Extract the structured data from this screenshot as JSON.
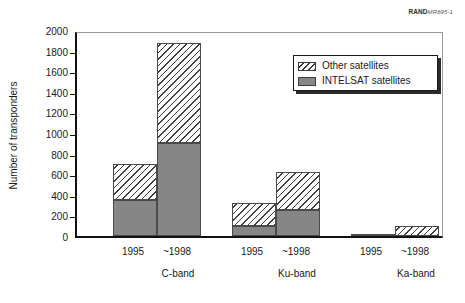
{
  "figure_id": {
    "brand": "RAND",
    "number": "MR695-1"
  },
  "chart_data": {
    "type": "bar",
    "subtype": "stacked-vertical",
    "title": "",
    "xlabel": "",
    "ylabel": "Number of transponders",
    "ylim": [
      0,
      2000
    ],
    "ytick_step": 200,
    "yticks": [
      0,
      200,
      400,
      600,
      800,
      1000,
      1200,
      1400,
      1600,
      1800,
      2000
    ],
    "ytick_labels": [
      "0",
      "200",
      "400",
      "600",
      "800",
      "1000",
      "1200",
      "1400",
      "1600",
      "1800",
      "2000"
    ],
    "grid": false,
    "legend_position": "upper-right-inside",
    "groups": [
      "C-band",
      "Ku-band",
      "Ka-band"
    ],
    "categories": [
      "1995",
      "~1998",
      "1995",
      "~1998",
      "1995",
      "~1998"
    ],
    "series": [
      {
        "name": "INTELSAT satellites",
        "color": "#868686",
        "fill": "solid",
        "values": [
          350,
          900,
          100,
          250,
          0,
          0
        ]
      },
      {
        "name": "Other satellites",
        "color": "#3d3d3d",
        "fill": "diagonal-hatch",
        "values": [
          350,
          970,
          225,
          370,
          20,
          100
        ]
      }
    ],
    "totals": [
      700,
      1870,
      325,
      620,
      20,
      100
    ]
  },
  "legend": {
    "items": [
      {
        "label": "Other satellites",
        "swatch": "other"
      },
      {
        "label": "INTELSAT satellites",
        "swatch": "intelsat"
      }
    ]
  },
  "axis": {
    "y_title": "Number of transponders"
  },
  "bars": [
    {
      "name": "c-band-1995",
      "group": "C-band",
      "year": "1995",
      "left": 36,
      "width": 44,
      "intelsat": 350,
      "other_top": 700
    },
    {
      "name": "c-band-1998",
      "group": "C-band",
      "year": "~1998",
      "left": 80,
      "width": 44,
      "intelsat": 900,
      "other_top": 1870
    },
    {
      "name": "ku-band-1995",
      "group": "Ku-band",
      "year": "1995",
      "left": 155,
      "width": 44,
      "intelsat": 100,
      "other_top": 325
    },
    {
      "name": "ku-band-1998",
      "group": "Ku-band",
      "year": "~1998",
      "left": 199,
      "width": 44,
      "intelsat": 250,
      "other_top": 620
    },
    {
      "name": "ka-band-1995",
      "group": "Ka-band",
      "year": "1995",
      "left": 274,
      "width": 44,
      "intelsat": 0,
      "other_top": 20
    },
    {
      "name": "ka-band-1998",
      "group": "Ka-band",
      "year": "~1998",
      "left": 318,
      "width": 44,
      "intelsat": 0,
      "other_top": 100
    }
  ],
  "group_label_x": [
    103,
    222,
    341
  ]
}
